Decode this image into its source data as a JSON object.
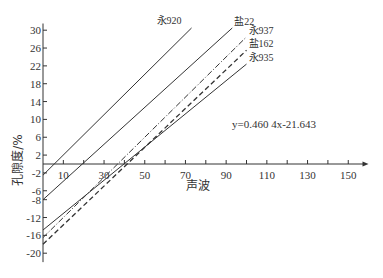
{
  "chart_data": {
    "type": "line",
    "title": "",
    "xlabel": "声波",
    "ylabel": "孔隙度/%",
    "xlim": [
      0,
      160
    ],
    "ylim": [
      -22,
      32
    ],
    "grid": false,
    "x_ticks": [
      10,
      30,
      50,
      70,
      90,
      110,
      130,
      150
    ],
    "x_minor_ticks": [
      20,
      40,
      60,
      80,
      100,
      120,
      140
    ],
    "y_ticks": [
      30,
      26,
      22,
      18,
      14,
      10,
      6,
      2,
      -2,
      -6,
      -8,
      -12,
      -16,
      -20
    ],
    "annotation": "y=0.460 4x-21.643",
    "series": [
      {
        "name": "永920",
        "style": "solid",
        "x": [
          0,
          73
        ],
        "y": [
          -2.5,
          30.5
        ]
      },
      {
        "name": "盐22",
        "style": "solid",
        "x": [
          0,
          93
        ],
        "y": [
          -8,
          30.5
        ]
      },
      {
        "name": "永937",
        "style": "dashdot",
        "x": [
          0,
          100
        ],
        "y": [
          -16.5,
          28.5
        ]
      },
      {
        "name": "盐162",
        "style": "dashed",
        "x": [
          0,
          100
        ],
        "y": [
          -18,
          25.5
        ]
      },
      {
        "name": "永935",
        "style": "solid",
        "x": [
          0,
          100
        ],
        "y": [
          -14.8,
          22.4
        ]
      }
    ]
  }
}
